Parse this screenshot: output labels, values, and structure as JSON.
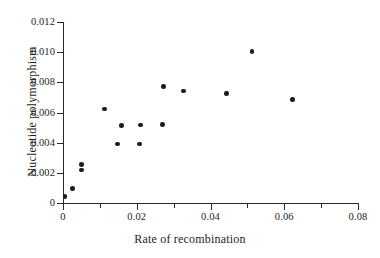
{
  "chart_data": {
    "type": "scatter",
    "title": "",
    "xlabel": "Rate of recombination",
    "ylabel": "Nucleotide polymorphism",
    "xlim": [
      0,
      0.08
    ],
    "ylim": [
      0,
      0.012
    ],
    "grid": false,
    "legend": null,
    "xticks": [
      0,
      0.01,
      0.02,
      0.03,
      0.04,
      0.05,
      0.06,
      0.07,
      0.08
    ],
    "xtick_labels": [
      "0",
      "",
      "0.02",
      "",
      "0.04",
      "",
      "0.06",
      "",
      "0.08"
    ],
    "yticks": [
      0,
      0.002,
      0.004,
      0.006,
      0.008,
      0.01,
      0.012
    ],
    "ytick_labels": [
      "0",
      "0.002",
      "0.004",
      "0.006",
      "0.008",
      "0.010",
      "0.012"
    ],
    "marker": "filled-circle",
    "marker_color": "#1b1b1b",
    "points": [
      {
        "x": 0.0005,
        "y": 0.00042
      },
      {
        "x": 0.0025,
        "y": 0.00098
      },
      {
        "x": 0.005,
        "y": 0.00254
      },
      {
        "x": 0.005,
        "y": 0.0022
      },
      {
        "x": 0.0112,
        "y": 0.00624
      },
      {
        "x": 0.0148,
        "y": 0.00392
      },
      {
        "x": 0.0158,
        "y": 0.00512
      },
      {
        "x": 0.0208,
        "y": 0.00392
      },
      {
        "x": 0.021,
        "y": 0.00518
      },
      {
        "x": 0.027,
        "y": 0.0052
      },
      {
        "x": 0.0272,
        "y": 0.00772
      },
      {
        "x": 0.0327,
        "y": 0.00742
      },
      {
        "x": 0.0443,
        "y": 0.00724
      },
      {
        "x": 0.0512,
        "y": 0.01004
      },
      {
        "x": 0.0622,
        "y": 0.00688
      }
    ]
  },
  "axes": {
    "x_title": "Rate of recombination",
    "y_title": "Nucleotide polymorphism"
  }
}
